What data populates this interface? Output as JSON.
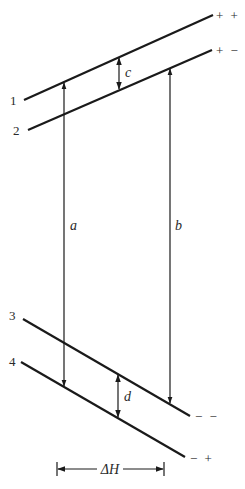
{
  "diagram": {
    "type": "level-shift diagram",
    "colors": {
      "stroke": "#1a1a1a",
      "text": "#2a2a2a",
      "background": "#ffffff"
    },
    "lines": [
      {
        "id": "1",
        "label": "1",
        "end_label": "+ +",
        "x1": 24,
        "y1": 100,
        "x2": 213,
        "y2": 15
      },
      {
        "id": "2",
        "label": "2",
        "end_label": "+ −",
        "x1": 28,
        "y1": 130,
        "x2": 212,
        "y2": 50
      },
      {
        "id": "3",
        "label": "3",
        "end_label": "− −",
        "x1": 23,
        "y1": 319,
        "x2": 190,
        "y2": 416
      },
      {
        "id": "4",
        "label": "4",
        "end_label": "− +",
        "x1": 21,
        "y1": 362,
        "x2": 185,
        "y2": 457
      }
    ],
    "arrows": [
      {
        "id": "a",
        "label": "a",
        "from_line": "1",
        "to_line": "4",
        "x": 64,
        "y1": 82,
        "y2": 387
      },
      {
        "id": "b",
        "label": "b",
        "from_line": "2",
        "to_line": "3",
        "x": 170,
        "y1": 68,
        "y2": 404
      },
      {
        "id": "c",
        "label": "c",
        "between": [
          "1",
          "2"
        ],
        "x": 119,
        "y1": 57,
        "y2": 90
      },
      {
        "id": "d",
        "label": "d",
        "between": [
          "3",
          "4"
        ],
        "x": 118,
        "y1": 374,
        "y2": 418
      }
    ],
    "span": {
      "label": "ΔH",
      "x1": 57,
      "x2": 164,
      "y": 469
    }
  }
}
